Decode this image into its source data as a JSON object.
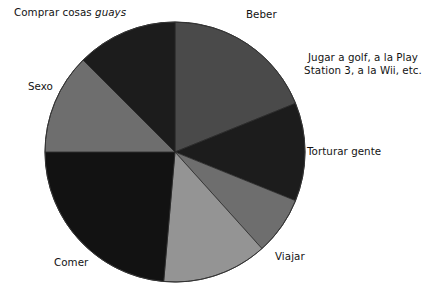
{
  "chart_data": {
    "type": "pie",
    "title": "",
    "subtitle": "",
    "legend_position": "none",
    "grid": false,
    "note": "Greyscale pie chart; slice labels placed outside the circle. Angles measured clockwise from 12 o'clock.",
    "categories": [
      "Beber",
      "Jugar a golf, a la Play Station 3, a la Wii, etc.",
      "Torturar gente",
      "Viajar",
      "Comer",
      "Sexo",
      "Comprar cosas guays"
    ],
    "values": [
      18.9,
      12.2,
      7.2,
      13.1,
      23.6,
      12.5,
      12.5
    ],
    "unit": "percent",
    "slices": [
      {
        "label": "Beber",
        "value": 18.9,
        "start_angle": 0,
        "end_angle": 68,
        "color": "#4a4a4a"
      },
      {
        "label": "Jugar a golf, a la Play Station 3, a la Wii, etc.",
        "value": 12.2,
        "start_angle": 68,
        "end_angle": 112,
        "color": "#1c1c1c"
      },
      {
        "label": "Torturar gente",
        "value": 7.2,
        "start_angle": 112,
        "end_angle": 138,
        "color": "#6e6e6e"
      },
      {
        "label": "Viajar",
        "value": 13.1,
        "start_angle": 138,
        "end_angle": 185,
        "color": "#949494"
      },
      {
        "label": "Comer",
        "value": 23.6,
        "start_angle": 185,
        "end_angle": 270,
        "color": "#121212"
      },
      {
        "label": "Sexo",
        "value": 12.5,
        "start_angle": 270,
        "end_angle": 315,
        "color": "#6e6e6e"
      },
      {
        "label": "Comprar cosas guays",
        "value": 12.5,
        "start_angle": 315,
        "end_angle": 360,
        "color": "#1c1c1c"
      }
    ],
    "geometry": {
      "center_x": 175,
      "center_y": 152,
      "radius": 130
    }
  },
  "labels": {
    "comprar_prefix": "Comprar cosas ",
    "comprar_italic": "guays",
    "beber": "Beber",
    "jugar_line1": "Jugar a golf, a la Play",
    "jugar_line2": "Station 3, a la Wii, etc.",
    "torturar": "Torturar gente",
    "viajar": "Viajar",
    "comer": "Comer",
    "sexo": "Sexo"
  },
  "colors": {
    "background": "#ffffff",
    "text": "#131313",
    "slice_outline": "#2a2a2a",
    "light_gray": "#949494",
    "mid_gray": "#6e6e6e",
    "dark_gray": "#4a4a4a",
    "near_black": "#1c1c1c",
    "black": "#121212"
  }
}
